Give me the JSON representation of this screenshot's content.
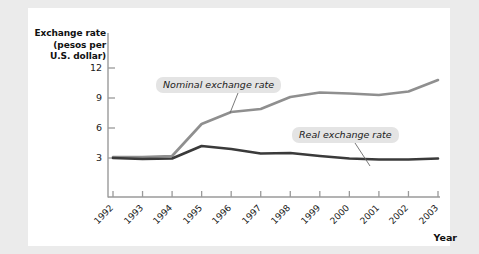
{
  "figure": {
    "background_color": "#ebebeb",
    "card_color": "#ffffff",
    "axis_color": "#9a9a9a",
    "x_axis_name": "Year"
  },
  "chart_data": {
    "type": "line",
    "title": "",
    "ylabel_lines": [
      "Exchange rate",
      "(pesos per",
      "U.S. dollar)"
    ],
    "ylabel": "Exchange rate (pesos per U.S. dollar)",
    "xlabel": "Year",
    "categories": [
      "1992",
      "1993",
      "1994",
      "1995",
      "1996",
      "1997",
      "1998",
      "1999",
      "2000",
      "2001",
      "2002",
      "2003"
    ],
    "x": [
      1992,
      1993,
      1994,
      1995,
      1996,
      1997,
      1998,
      1999,
      2000,
      2001,
      2002,
      2003
    ],
    "yticks": [
      3,
      6,
      9,
      12
    ],
    "ylim": [
      0,
      13
    ],
    "xlim": [
      1991.5,
      2003.5
    ],
    "grid": false,
    "legend": "inline-annotations",
    "series": [
      {
        "name": "Nominal exchange rate",
        "color": "#8f8f8f",
        "values": [
          3.1,
          3.1,
          3.2,
          6.4,
          7.6,
          7.9,
          9.1,
          9.55,
          9.45,
          9.3,
          9.65,
          10.8
        ]
      },
      {
        "name": "Real exchange rate",
        "color": "#3a3a3a",
        "values": [
          3.0,
          2.9,
          2.95,
          4.2,
          3.9,
          3.45,
          3.5,
          3.2,
          2.95,
          2.85,
          2.85,
          2.95
        ]
      }
    ],
    "annotations": [
      {
        "text": "Nominal exchange rate",
        "series": "Nominal exchange rate"
      },
      {
        "text": "Real exchange rate",
        "series": "Real exchange rate"
      }
    ]
  }
}
